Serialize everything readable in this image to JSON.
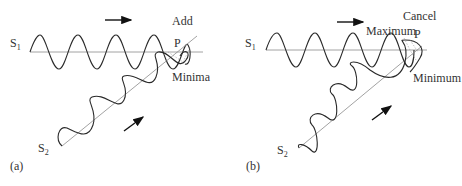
{
  "figure": {
    "panels": [
      {
        "id": "a",
        "caption": "(a)",
        "source1": {
          "name": "S",
          "sub": "1"
        },
        "source2": {
          "name": "S",
          "sub": "2"
        },
        "point_label": "P",
        "result_label": "Add",
        "extra_label": "Minima"
      },
      {
        "id": "b",
        "caption": "(b)",
        "source1": {
          "name": "S",
          "sub": "1"
        },
        "source2": {
          "name": "S",
          "sub": "2"
        },
        "point_label": "P",
        "result_label": "Cancel",
        "extra_label": "Maximum",
        "extra_label2": "Minimum"
      }
    ],
    "colors": {
      "wave": "#2a2a2a",
      "axis": "#8a8a8a",
      "text": "#333333"
    }
  }
}
